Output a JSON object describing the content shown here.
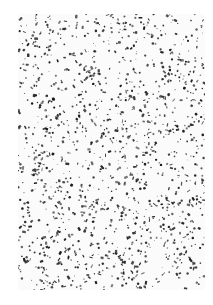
{
  "image": {
    "subject": "speckle pattern",
    "description": "Dense random black flecks and specks on a white rectangular field",
    "background_color": "#ffffff",
    "panel_color": "#fbfbfb",
    "speck_color": "#1a1a1a",
    "panel": {
      "x": 18,
      "y": 14,
      "width": 187,
      "height": 276
    },
    "speck_count": 1400,
    "seed": 7
  }
}
